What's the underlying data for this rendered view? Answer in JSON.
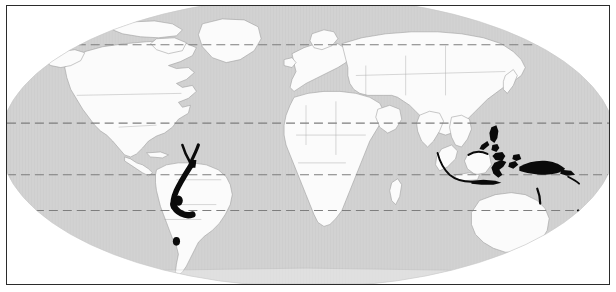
{
  "figure": {
    "type": "distribution-map",
    "title": "",
    "projection": "elliptical world projection",
    "frame_color": "#2b2b2b",
    "ocean_color": "#d2d2d2",
    "land_color": "#fbfbfb",
    "border_color": "#9a9a9a",
    "outside_globe_color": "#ffffff",
    "distribution_color": "#0a0a0a"
  },
  "graticule": {
    "line_color": "#7e7e7e",
    "line_style": "dashed",
    "lines": [
      {
        "name": "arctic-circle",
        "y": 39
      },
      {
        "name": "tropic-of-cancer",
        "y": 118
      },
      {
        "name": "equator",
        "y": 170
      },
      {
        "name": "tropic-of-capricorn",
        "y": 206
      }
    ]
  },
  "distribution": {
    "label": "",
    "regions": [
      {
        "name": "northern-andes-colombia-venezuela",
        "kind": "band"
      },
      {
        "name": "andes-ecuador-peru",
        "kind": "band"
      },
      {
        "name": "bolivia-dot",
        "kind": "point"
      },
      {
        "name": "central-chile-dot",
        "kind": "point"
      },
      {
        "name": "philippines",
        "kind": "archipelago"
      },
      {
        "name": "sulawesi",
        "kind": "island"
      },
      {
        "name": "moluccas",
        "kind": "archipelago"
      },
      {
        "name": "new-guinea",
        "kind": "island"
      },
      {
        "name": "sumatra-java-arc",
        "kind": "arc"
      },
      {
        "name": "lesser-sunda-islands",
        "kind": "archipelago"
      },
      {
        "name": "borneo-north-edge",
        "kind": "coast"
      },
      {
        "name": "new-caledonia",
        "kind": "island"
      },
      {
        "name": "new-zealand",
        "kind": "island"
      },
      {
        "name": "solomon-islands",
        "kind": "archipelago"
      }
    ]
  },
  "continents": [
    {
      "name": "north-america"
    },
    {
      "name": "south-america"
    },
    {
      "name": "greenland"
    },
    {
      "name": "europe"
    },
    {
      "name": "africa"
    },
    {
      "name": "asia"
    },
    {
      "name": "australia"
    },
    {
      "name": "antarctica-edge"
    }
  ]
}
